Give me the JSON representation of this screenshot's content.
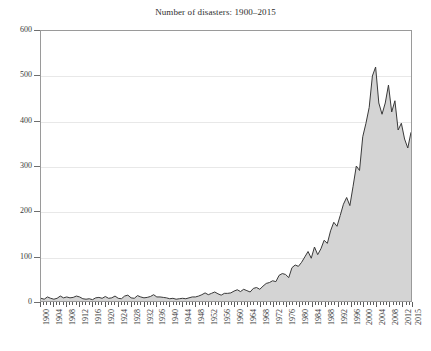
{
  "chart_data": {
    "type": "area",
    "title": "Number of disasters: 1900–2015",
    "xlabel": "",
    "ylabel": "",
    "xlim": [
      1900,
      2015
    ],
    "ylim": [
      0,
      600
    ],
    "grid": true,
    "legend": "none",
    "series_name": "Number of disasters",
    "fill_color": "#d4d4d4",
    "line_color": "#3a3a3a",
    "grid_color": "#e8e8e8",
    "frame_color": "#9a9a9a",
    "y_ticks": [
      0,
      100,
      200,
      300,
      400,
      500,
      600
    ],
    "x_ticks": [
      1900,
      1904,
      1908,
      1912,
      1916,
      1920,
      1924,
      1928,
      1932,
      1936,
      1940,
      1944,
      1948,
      1952,
      1956,
      1960,
      1964,
      1968,
      1972,
      1976,
      1980,
      1984,
      1988,
      1992,
      1996,
      2000,
      2004,
      2008,
      2012,
      2015
    ],
    "x": [
      1900,
      1901,
      1902,
      1903,
      1904,
      1905,
      1906,
      1907,
      1908,
      1909,
      1910,
      1911,
      1912,
      1913,
      1914,
      1915,
      1916,
      1917,
      1918,
      1919,
      1920,
      1921,
      1922,
      1923,
      1924,
      1925,
      1926,
      1927,
      1928,
      1929,
      1930,
      1931,
      1932,
      1933,
      1934,
      1935,
      1936,
      1937,
      1938,
      1939,
      1940,
      1941,
      1942,
      1943,
      1944,
      1945,
      1946,
      1947,
      1948,
      1949,
      1950,
      1951,
      1952,
      1953,
      1954,
      1955,
      1956,
      1957,
      1958,
      1959,
      1960,
      1961,
      1962,
      1963,
      1964,
      1965,
      1966,
      1967,
      1968,
      1969,
      1970,
      1971,
      1972,
      1973,
      1974,
      1975,
      1976,
      1977,
      1978,
      1979,
      1980,
      1981,
      1982,
      1983,
      1984,
      1985,
      1986,
      1987,
      1988,
      1989,
      1990,
      1991,
      1992,
      1993,
      1994,
      1995,
      1996,
      1997,
      1998,
      1999,
      2000,
      2001,
      2002,
      2003,
      2004,
      2005,
      2006,
      2007,
      2008,
      2009,
      2010,
      2011,
      2012,
      2013,
      2014,
      2015
    ],
    "values": [
      6,
      4,
      9,
      6,
      4,
      6,
      11,
      7,
      9,
      7,
      8,
      11,
      9,
      5,
      4,
      5,
      3,
      7,
      8,
      6,
      10,
      6,
      7,
      11,
      6,
      5,
      11,
      13,
      7,
      6,
      12,
      9,
      7,
      8,
      10,
      14,
      9,
      9,
      8,
      7,
      5,
      6,
      4,
      5,
      6,
      5,
      7,
      9,
      9,
      11,
      14,
      18,
      14,
      17,
      20,
      16,
      13,
      17,
      17,
      18,
      22,
      25,
      21,
      26,
      23,
      20,
      28,
      30,
      26,
      33,
      39,
      41,
      45,
      43,
      57,
      61,
      59,
      52,
      74,
      80,
      77,
      86,
      98,
      110,
      95,
      120,
      103,
      116,
      135,
      128,
      156,
      175,
      166,
      190,
      215,
      230,
      212,
      255,
      300,
      290,
      365,
      395,
      430,
      500,
      520,
      440,
      415,
      440,
      480,
      420,
      445,
      380,
      395,
      360,
      340,
      375
    ],
    "annotations": []
  }
}
